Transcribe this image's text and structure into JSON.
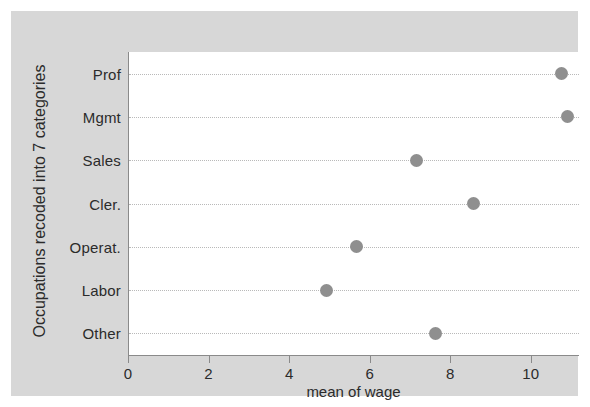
{
  "chart_data": {
    "type": "scatter",
    "title": "",
    "subtitle": "",
    "xlabel": "mean of wage",
    "ylabel": "Occupations recoded into 7 categories",
    "categories": [
      "Prof",
      "Mgmt",
      "Sales",
      "Cler.",
      "Operat.",
      "Labor",
      "Other"
    ],
    "values": [
      10.75,
      10.9,
      7.15,
      8.55,
      5.65,
      4.9,
      7.6
    ],
    "series": [
      {
        "name": "mean of wage",
        "values": [
          10.75,
          10.9,
          7.15,
          8.55,
          5.65,
          4.9,
          7.6
        ]
      }
    ],
    "xlim": [
      0,
      11.2
    ],
    "xticks": [
      0,
      2,
      4,
      6,
      8,
      10
    ],
    "xticklabels": [
      "0",
      "2",
      "4",
      "6",
      "8",
      "10"
    ],
    "grid": "horizontal-dotted",
    "legend": "none",
    "marker": "filled-circle",
    "marker_color": "#8f8f8f",
    "grid_color": "#b9b9b9",
    "axis_color": "#8a8a8a",
    "panel_background": "#d7d7d7",
    "plot_background": "#ffffff",
    "text_color": "#2b2b2b"
  }
}
